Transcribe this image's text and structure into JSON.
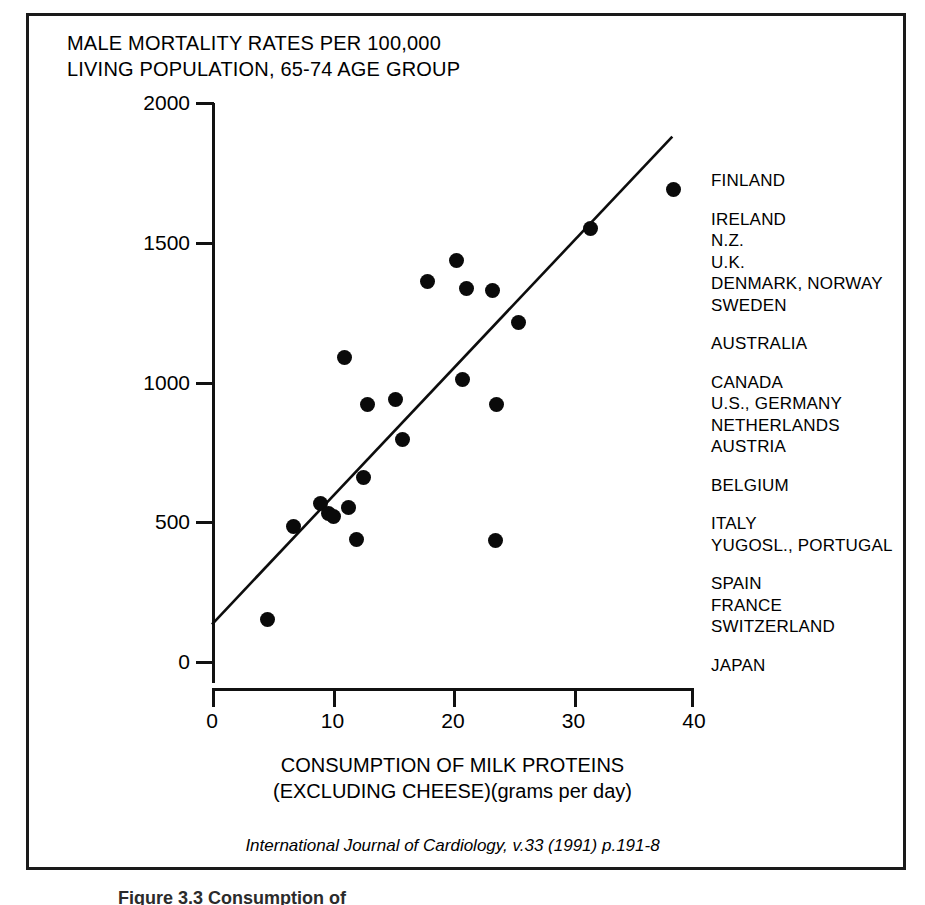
{
  "figure": {
    "title_lines": [
      "MALE MORTALITY RATES PER 100,000",
      "LIVING POPULATION, 65-74 AGE GROUP"
    ],
    "x_caption_lines": [
      "CONSUMPTION OF MILK PROTEINS",
      "(EXCLUDING CHEESE)(grams per day)"
    ],
    "citation": "International Journal of Cardiology, v.33 (1991) p.191-8",
    "caption_below": "Figure 3.3  Consumption of"
  },
  "chart_data": {
    "type": "scatter",
    "title": "MALE MORTALITY RATES PER 100,000 LIVING POPULATION, 65-74 AGE GROUP",
    "xlabel": "CONSUMPTION OF MILK PROTEINS (EXCLUDING CHEESE)(grams per day)",
    "ylabel": "MALE MORTALITY RATES PER 100,000 LIVING POPULATION, 65-74 AGE GROUP",
    "xlim": [
      0,
      40
    ],
    "ylim": [
      0,
      2000
    ],
    "xticks": [
      0,
      10,
      20,
      30,
      40
    ],
    "yticks": [
      0,
      500,
      1000,
      1500,
      2000
    ],
    "xtick_labels": [
      "0",
      "10",
      "20",
      "30",
      "40"
    ],
    "ytick_labels": [
      "0",
      "500",
      "1000",
      "1500",
      "2000"
    ],
    "grid": false,
    "legend": "none",
    "points": [
      {
        "x": 4.6,
        "y": 152,
        "label": "JAPAN"
      },
      {
        "x": 6.8,
        "y": 485,
        "label": "SWITZERLAND"
      },
      {
        "x": 9.0,
        "y": 568,
        "label": "FRANCE"
      },
      {
        "x": 9.7,
        "y": 530,
        "label": "SPAIN"
      },
      {
        "x": 10.1,
        "y": 520,
        "label": "PORTUGAL"
      },
      {
        "x": 11.0,
        "y": 1090,
        "label": "YUGOSLAVIA"
      },
      {
        "x": 11.3,
        "y": 552,
        "label": "ITALY"
      },
      {
        "x": 12.0,
        "y": 440,
        "label": "BELGIUM"
      },
      {
        "x": 12.6,
        "y": 660,
        "label": "AUSTRIA"
      },
      {
        "x": 12.9,
        "y": 920,
        "label": "NETHERLANDS"
      },
      {
        "x": 15.2,
        "y": 940,
        "label": "GERMANY"
      },
      {
        "x": 15.8,
        "y": 795,
        "label": "U.S."
      },
      {
        "x": 17.9,
        "y": 1360,
        "label": "CANADA"
      },
      {
        "x": 20.3,
        "y": 1435,
        "label": "AUSTRALIA"
      },
      {
        "x": 20.8,
        "y": 1010,
        "label": "SWEDEN"
      },
      {
        "x": 21.1,
        "y": 1335,
        "label": "DENMARK"
      },
      {
        "x": 23.3,
        "y": 1330,
        "label": "NORWAY"
      },
      {
        "x": 23.5,
        "y": 435,
        "label": "U.K."
      },
      {
        "x": 23.6,
        "y": 920,
        "label": "N.Z."
      },
      {
        "x": 25.4,
        "y": 1215,
        "label": "IRELAND"
      },
      {
        "x": 31.4,
        "y": 1550,
        "label": "IRELAND-2"
      },
      {
        "x": 38.3,
        "y": 1690,
        "label": "FINLAND"
      }
    ],
    "trendline": {
      "x0": 0.0,
      "y0": 135,
      "x1": 38.2,
      "y1": 1880
    }
  },
  "annotations": {
    "groups": [
      {
        "lines": [
          "FINLAND"
        ]
      },
      {
        "lines": [
          "IRELAND",
          "N.Z.",
          "U.K.",
          "DENMARK, NORWAY",
          "SWEDEN"
        ]
      },
      {
        "lines": [
          "AUSTRALIA"
        ]
      },
      {
        "lines": [
          "CANADA",
          "U.S., GERMANY",
          "NETHERLANDS",
          "AUSTRIA"
        ]
      },
      {
        "lines": [
          "BELGIUM"
        ]
      },
      {
        "lines": [
          "ITALY",
          "YUGOSL., PORTUGAL"
        ]
      },
      {
        "lines": [
          "SPAIN",
          "FRANCE",
          "SWITZERLAND"
        ]
      },
      {
        "lines": [
          "JAPAN"
        ]
      }
    ]
  }
}
